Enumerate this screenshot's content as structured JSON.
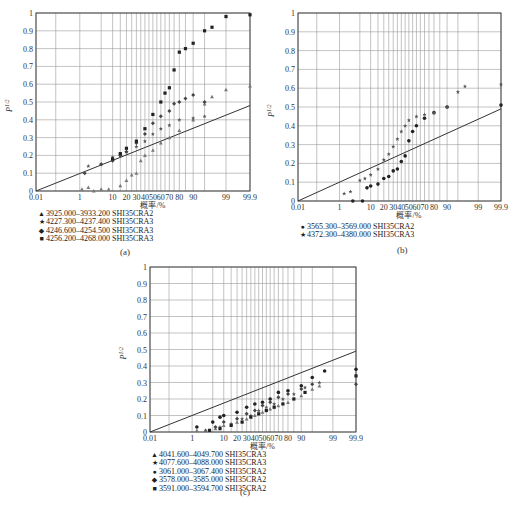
{
  "figures": [
    {
      "id": "a",
      "caption": "(a)",
      "x_axis_label": "概率/%",
      "y_axis_label": "P^1/2",
      "legend": [
        {
          "marker": "▲",
          "label": "3925.000–3933.200 SHI35CRA2"
        },
        {
          "marker": "★",
          "label": "4227.300–4237.400 SHI35CRA3"
        },
        {
          "marker": "◆",
          "label": "4246.600–4254.500 SHI35CRA3"
        },
        {
          "marker": "■",
          "label": "4256.200–4268.000 SHI35CRA3"
        }
      ]
    },
    {
      "id": "b",
      "caption": "(b)",
      "x_axis_label": "概率/%",
      "y_axis_label": "P^1/2",
      "legend": [
        {
          "marker": "●",
          "label": "3565.300–3569.000 SHI35CRA2"
        },
        {
          "marker": "★",
          "label": "4372.300–4380.000 SHI35CRA3"
        }
      ]
    },
    {
      "id": "c",
      "caption": "(c)",
      "x_axis_label": "概率/%",
      "y_axis_label": "P^1/2",
      "legend": [
        {
          "marker": "▲",
          "label": "4041.600–4049.700 SHI35CRA3"
        },
        {
          "marker": "★",
          "label": "4077.600–4088.000 SHI35CRA3"
        },
        {
          "marker": "●",
          "label": "3061.000–3067.400 SHI35CRA2"
        },
        {
          "marker": "◆",
          "label": "3578.000–3585.000 SHI35CRA2"
        },
        {
          "marker": "■",
          "label": "3591.000–3594.700 SHI35CRA2"
        }
      ]
    }
  ],
  "chart_data": [
    {
      "type": "scatter",
      "title": "(a)",
      "xlabel": "概率/%",
      "ylabel": "P^1/2",
      "x_scale": "normal-probability",
      "x_tick_labels": [
        "0.01",
        "1",
        "10",
        "20",
        "30",
        "40",
        "50",
        "60",
        "70",
        "80",
        "90",
        "99",
        "99.9"
      ],
      "y_ticks": [
        0,
        0.1,
        0.2,
        0.3,
        0.4,
        0.5,
        0.6,
        0.7,
        0.8,
        0.9,
        1
      ],
      "ylim": [
        0,
        1
      ],
      "xlim": [
        0.01,
        99.9
      ],
      "grid": true,
      "reference_line": {
        "from": [
          0.01,
          0
        ],
        "to": [
          99.9,
          0.48
        ]
      },
      "series": [
        {
          "name": "3925.000–3933.200 SHI35CRA2",
          "marker": "triangle",
          "points": [
            [
              1.2,
              0.01
            ],
            [
              2,
              0.02
            ],
            [
              3,
              0.0
            ],
            [
              5,
              0.01
            ],
            [
              8,
              0.01
            ],
            [
              15,
              0.03
            ],
            [
              20,
              0.06
            ],
            [
              25,
              0.09
            ],
            [
              30,
              0.1
            ],
            [
              35,
              0.17
            ],
            [
              40,
              0.2
            ],
            [
              50,
              0.23
            ],
            [
              60,
              0.27
            ],
            [
              70,
              0.3
            ],
            [
              80,
              0.34
            ],
            [
              90,
              0.4
            ],
            [
              95,
              0.49
            ],
            [
              97,
              0.53
            ],
            [
              99,
              0.57
            ],
            [
              99.9,
              0.59
            ]
          ]
        },
        {
          "name": "4227.300–4237.400 SHI35CRA3",
          "marker": "star",
          "points": [
            [
              2,
              0.14
            ],
            [
              5,
              0.15
            ],
            [
              10,
              0.19
            ],
            [
              15,
              0.2
            ],
            [
              20,
              0.22
            ],
            [
              30,
              0.25
            ],
            [
              40,
              0.28
            ],
            [
              50,
              0.32
            ],
            [
              60,
              0.35
            ],
            [
              70,
              0.37
            ],
            [
              80,
              0.4
            ],
            [
              90,
              0.41
            ],
            [
              95,
              0.42
            ]
          ]
        },
        {
          "name": "4246.600–4254.500 SHI35CRA3",
          "marker": "diamond",
          "points": [
            [
              1.5,
              0.1
            ],
            [
              5,
              0.15
            ],
            [
              10,
              0.17
            ],
            [
              15,
              0.2
            ],
            [
              20,
              0.22
            ],
            [
              30,
              0.27
            ],
            [
              40,
              0.32
            ],
            [
              50,
              0.38
            ],
            [
              60,
              0.42
            ],
            [
              70,
              0.45
            ],
            [
              75,
              0.49
            ],
            [
              80,
              0.5
            ],
            [
              85,
              0.52
            ],
            [
              90,
              0.54
            ],
            [
              95,
              0.5
            ]
          ]
        },
        {
          "name": "4256.200–4268.000 SHI35CRA3",
          "marker": "square",
          "points": [
            [
              10,
              0.18
            ],
            [
              15,
              0.21
            ],
            [
              20,
              0.24
            ],
            [
              30,
              0.28
            ],
            [
              40,
              0.35
            ],
            [
              50,
              0.43
            ],
            [
              60,
              0.5
            ],
            [
              65,
              0.55
            ],
            [
              70,
              0.58
            ],
            [
              75,
              0.68
            ],
            [
              80,
              0.78
            ],
            [
              85,
              0.8
            ],
            [
              90,
              0.83
            ],
            [
              95,
              0.9
            ],
            [
              97,
              0.92
            ],
            [
              99,
              0.98
            ],
            [
              99.9,
              0.99
            ]
          ]
        }
      ]
    },
    {
      "type": "scatter",
      "title": "(b)",
      "xlabel": "概率/%",
      "ylabel": "P^1/2",
      "x_scale": "normal-probability",
      "x_tick_labels": [
        "0.01",
        "1",
        "10",
        "20",
        "30",
        "40",
        "50",
        "60",
        "70",
        "80",
        "90",
        "99",
        "99.9"
      ],
      "y_ticks": [
        0,
        0.1,
        0.2,
        0.3,
        0.4,
        0.5,
        0.6,
        0.7,
        0.8,
        0.9,
        1
      ],
      "ylim": [
        0,
        1
      ],
      "xlim": [
        0.01,
        99.9
      ],
      "grid": true,
      "reference_line": {
        "from": [
          0.01,
          0
        ],
        "to": [
          99.9,
          0.49
        ]
      },
      "series": [
        {
          "name": "3565.300–3569.000 SHI35CRA2",
          "marker": "circle",
          "points": [
            [
              3,
              0.0
            ],
            [
              6,
              0.0
            ],
            [
              8,
              0.07
            ],
            [
              10,
              0.08
            ],
            [
              15,
              0.09
            ],
            [
              20,
              0.12
            ],
            [
              25,
              0.13
            ],
            [
              30,
              0.16
            ],
            [
              35,
              0.17
            ],
            [
              40,
              0.21
            ],
            [
              45,
              0.24
            ],
            [
              50,
              0.32
            ],
            [
              55,
              0.37
            ],
            [
              60,
              0.4
            ],
            [
              70,
              0.44
            ],
            [
              80,
              0.47
            ],
            [
              90,
              0.5
            ],
            [
              99.9,
              0.51
            ]
          ]
        },
        {
          "name": "4372.300–4380.000 SHI35CRA3",
          "marker": "star",
          "points": [
            [
              1.5,
              0.04
            ],
            [
              2.5,
              0.05
            ],
            [
              5,
              0.11
            ],
            [
              7,
              0.12
            ],
            [
              10,
              0.14
            ],
            [
              15,
              0.17
            ],
            [
              20,
              0.22
            ],
            [
              25,
              0.25
            ],
            [
              30,
              0.29
            ],
            [
              35,
              0.33
            ],
            [
              40,
              0.37
            ],
            [
              45,
              0.4
            ],
            [
              50,
              0.43
            ],
            [
              60,
              0.45
            ],
            [
              70,
              0.46
            ],
            [
              80,
              0.47
            ],
            [
              90,
              0.5
            ],
            [
              95,
              0.58
            ],
            [
              97,
              0.61
            ],
            [
              99.9,
              0.62
            ]
          ]
        }
      ]
    },
    {
      "type": "scatter",
      "title": "(c)",
      "xlabel": "概率/%",
      "ylabel": "P^1/2",
      "x_scale": "normal-probability",
      "x_tick_labels": [
        "0.01",
        "1",
        "10",
        "20",
        "30",
        "40",
        "50",
        "60",
        "70",
        "80",
        "90",
        "99",
        "99.9"
      ],
      "y_ticks": [
        0,
        0.1,
        0.2,
        0.3,
        0.4,
        0.5,
        0.6,
        0.7,
        0.8,
        0.9,
        1
      ],
      "ylim": [
        0,
        1
      ],
      "xlim": [
        0.01,
        99.9
      ],
      "grid": true,
      "reference_line": {
        "from": [
          0.01,
          0
        ],
        "to": [
          99.9,
          0.49
        ]
      },
      "series": [
        {
          "name": "4041.600–4049.700 SHI35CRA3",
          "marker": "triangle",
          "points": [
            [
              1.5,
              0.01
            ],
            [
              3,
              0.01
            ],
            [
              6,
              0.02
            ],
            [
              10,
              0.04
            ],
            [
              20,
              0.06
            ],
            [
              30,
              0.08
            ],
            [
              40,
              0.1
            ],
            [
              50,
              0.12
            ],
            [
              60,
              0.14
            ],
            [
              70,
              0.16
            ],
            [
              80,
              0.18
            ],
            [
              90,
              0.22
            ],
            [
              95,
              0.26
            ],
            [
              97,
              0.28
            ]
          ]
        },
        {
          "name": "4077.600–4088.000 SHI35CRA3",
          "marker": "star",
          "points": [
            [
              3,
              0.01
            ],
            [
              8,
              0.03
            ],
            [
              15,
              0.05
            ],
            [
              25,
              0.08
            ],
            [
              35,
              0.1
            ],
            [
              45,
              0.13
            ],
            [
              55,
              0.15
            ],
            [
              65,
              0.17
            ],
            [
              75,
              0.2
            ],
            [
              85,
              0.23
            ],
            [
              92,
              0.27
            ],
            [
              97,
              0.3
            ]
          ]
        },
        {
          "name": "3061.000–3067.400 SHI35CRA2",
          "marker": "circle",
          "points": [
            [
              1.5,
              0.03
            ],
            [
              5,
              0.06
            ],
            [
              8,
              0.09
            ],
            [
              10,
              0.1
            ],
            [
              20,
              0.12
            ],
            [
              30,
              0.15
            ],
            [
              40,
              0.17
            ],
            [
              50,
              0.18
            ],
            [
              60,
              0.2
            ],
            [
              70,
              0.24
            ],
            [
              80,
              0.25
            ],
            [
              90,
              0.28
            ],
            [
              95,
              0.33
            ],
            [
              98,
              0.37
            ],
            [
              99.9,
              0.38
            ]
          ]
        },
        {
          "name": "3578.000–3585.000 SHI35CRA2",
          "marker": "diamond",
          "points": [
            [
              6,
              0.03
            ],
            [
              10,
              0.06
            ],
            [
              20,
              0.08
            ],
            [
              30,
              0.11
            ],
            [
              40,
              0.13
            ],
            [
              50,
              0.16
            ],
            [
              60,
              0.18
            ],
            [
              70,
              0.21
            ],
            [
              80,
              0.23
            ],
            [
              90,
              0.26
            ],
            [
              95,
              0.29
            ],
            [
              99.9,
              0.29
            ]
          ]
        },
        {
          "name": "3591.000–3594.700 SHI35CRA2",
          "marker": "square",
          "points": [
            [
              4,
              0.01
            ],
            [
              8,
              0.02
            ],
            [
              15,
              0.04
            ],
            [
              25,
              0.06
            ],
            [
              35,
              0.09
            ],
            [
              45,
              0.11
            ],
            [
              55,
              0.13
            ],
            [
              65,
              0.15
            ],
            [
              75,
              0.17
            ],
            [
              85,
              0.2
            ],
            [
              92,
              0.24
            ],
            [
              99.9,
              0.34
            ]
          ]
        }
      ]
    }
  ]
}
